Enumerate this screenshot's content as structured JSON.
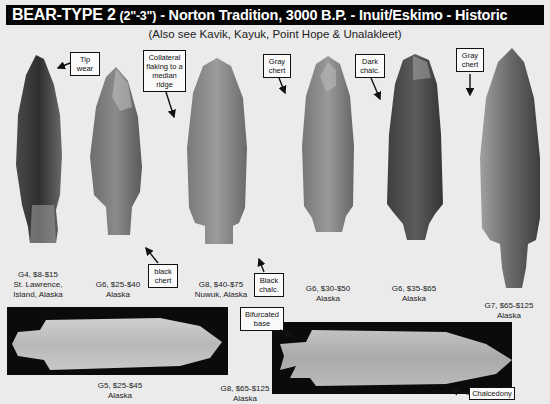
{
  "header": {
    "title_main": "BEAR-TYPE 2",
    "title_size": "(2\"-3\")",
    "title_rest": "- Norton Tradition, 3000 B.P. - Inuit/Eskimo - Historic",
    "subtitle": "(Also see Kavik, Kayuk, Point Hope & Unalakleet)"
  },
  "callouts": {
    "tip_wear": "Tip wear",
    "collateral": "Collateral flaking to a median ridge",
    "gray_chert_1": "Gray chert",
    "dark_chalc": "Dark chalc.",
    "gray_chert_2": "Gray chert",
    "black_chert": "black chert",
    "black_chalc": "Black chalc.",
    "bifurcated_base": "Bifurcated base",
    "chalcedony": "Chalcedony"
  },
  "specimens": [
    {
      "grade": "G4, $8-$15",
      "location": "St. Lawrence,",
      "location2": "Island, Alaska"
    },
    {
      "grade": "G6, $25-$40",
      "location": "Alaska"
    },
    {
      "grade": "G8, $40-$75",
      "location": "Nuwuk, Alaska"
    },
    {
      "grade": "G6, $30-$50",
      "location": "Alaska"
    },
    {
      "grade": "G6, $35-$65",
      "location": "Alaska"
    },
    {
      "grade": "G7, $65-$125",
      "location": "Alaska"
    },
    {
      "grade": "G5, $25-$45",
      "location": "Alaska"
    },
    {
      "grade": "G8, $65-$125",
      "location": "Alaska"
    }
  ],
  "colors": {
    "background": "#ebebeb",
    "title_bar": "#050505",
    "photo_box": "#0b0b0b"
  }
}
